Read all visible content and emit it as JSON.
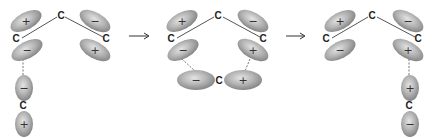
{
  "diagram": {
    "title": "",
    "colors": {
      "lobe_light": "#dcdcdc",
      "lobe_dark": "#8a8a8a",
      "bond": "#555555",
      "text": "#222222"
    },
    "arrows": [
      {
        "label": "→",
        "from_panel": 1,
        "to_panel": 2
      },
      {
        "label": "→",
        "from_panel": 2,
        "to_panel": 3
      }
    ],
    "panels": [
      {
        "id": 1,
        "atoms": [
          {
            "label": "C",
            "x": 16,
            "y": 42
          },
          {
            "label": "C",
            "x": 60,
            "y": 19
          },
          {
            "label": "C",
            "x": 106,
            "y": 42
          },
          {
            "label": "C",
            "x": 23,
            "y": 108
          }
        ],
        "lobes": [
          {
            "sign": "+",
            "cx": 26,
            "cy": 21,
            "rx": 17,
            "ry": 8.5,
            "rot": -28
          },
          {
            "sign": "−",
            "cx": 27,
            "cy": 50,
            "rx": 17,
            "ry": 8.5,
            "rot": -28
          },
          {
            "sign": "−",
            "cx": 95,
            "cy": 21,
            "rx": 17,
            "ry": 8.5,
            "rot": 30
          },
          {
            "sign": "+",
            "cx": 95,
            "cy": 50,
            "rx": 17,
            "ry": 8.5,
            "rot": 30
          },
          {
            "sign": "−",
            "cx": 24,
            "cy": 88,
            "rx": 9,
            "ry": 13,
            "rot": 0
          },
          {
            "sign": "+",
            "cx": 24,
            "cy": 124,
            "rx": 9,
            "ry": 13,
            "rot": 0
          }
        ]
      },
      {
        "id": 2,
        "atoms": [
          {
            "label": "C",
            "x": 171,
            "y": 42
          },
          {
            "label": "C",
            "x": 218,
            "y": 19
          },
          {
            "label": "C",
            "x": 263,
            "y": 42
          },
          {
            "label": "C",
            "x": 219,
            "y": 84
          }
        ],
        "lobes": [
          {
            "sign": "+",
            "cx": 182,
            "cy": 21,
            "rx": 17,
            "ry": 8.5,
            "rot": -28
          },
          {
            "sign": "−",
            "cx": 183,
            "cy": 50,
            "rx": 17,
            "ry": 8.5,
            "rot": -28
          },
          {
            "sign": "−",
            "cx": 253,
            "cy": 21,
            "rx": 17,
            "ry": 8.5,
            "rot": 30
          },
          {
            "sign": "+",
            "cx": 253,
            "cy": 50,
            "rx": 17,
            "ry": 8.5,
            "rot": 30
          },
          {
            "sign": "−",
            "cx": 196,
            "cy": 80,
            "rx": 19,
            "ry": 10,
            "rot": 0
          },
          {
            "sign": "+",
            "cx": 243,
            "cy": 80,
            "rx": 19,
            "ry": 10,
            "rot": 0
          }
        ]
      },
      {
        "id": 3,
        "atoms": [
          {
            "label": "C",
            "x": 326,
            "y": 42
          },
          {
            "label": "C",
            "x": 372,
            "y": 19
          },
          {
            "label": "C",
            "x": 418,
            "y": 42
          },
          {
            "label": "C",
            "x": 409,
            "y": 108
          }
        ],
        "lobes": [
          {
            "sign": "+",
            "cx": 340,
            "cy": 21,
            "rx": 17,
            "ry": 8.5,
            "rot": -28
          },
          {
            "sign": "−",
            "cx": 340,
            "cy": 50,
            "rx": 17,
            "ry": 8.5,
            "rot": -28
          },
          {
            "sign": "−",
            "cx": 408,
            "cy": 21,
            "rx": 17,
            "ry": 8.5,
            "rot": 30
          },
          {
            "sign": "+",
            "cx": 408,
            "cy": 50,
            "rx": 17,
            "ry": 8.5,
            "rot": 30
          },
          {
            "sign": "+",
            "cx": 410,
            "cy": 88,
            "rx": 9,
            "ry": 13,
            "rot": 0
          },
          {
            "sign": "−",
            "cx": 410,
            "cy": 124,
            "rx": 9,
            "ry": 13,
            "rot": 0
          }
        ]
      }
    ]
  }
}
